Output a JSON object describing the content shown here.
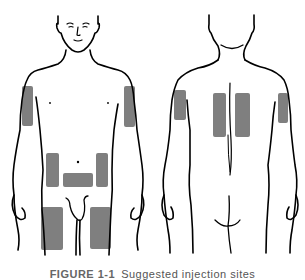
{
  "caption": {
    "label": "FIGURE 1-1",
    "text": "Suggested injection sites"
  },
  "colors": {
    "outline": "#000000",
    "site_fill": "#7f7f7f",
    "background": "#ffffff"
  },
  "figures": [
    {
      "view": "front",
      "sites": [
        "left-upper-arm",
        "right-upper-arm",
        "left-abdomen",
        "right-abdomen",
        "lower-abdomen",
        "left-thigh",
        "right-thigh"
      ]
    },
    {
      "view": "back",
      "sites": [
        "left-upper-arm",
        "right-upper-arm",
        "left-upper-back",
        "right-upper-back"
      ]
    }
  ]
}
